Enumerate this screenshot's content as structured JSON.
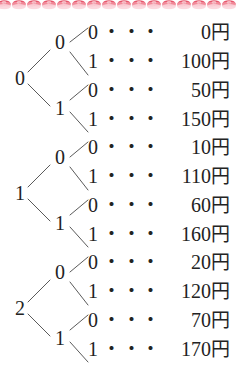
{
  "figure": {
    "currency_unit": "円",
    "dot_leader": "・",
    "line_color": "#5a5a5a",
    "text_color": "#232323",
    "border_color": "#e8596b",
    "background": "#ffffff"
  },
  "top_border": {
    "name": "decorative-scallop-border",
    "repeat_count": 16,
    "colors": [
      "#e4485f",
      "#f2909f",
      "#fbd4da"
    ]
  },
  "tree": {
    "groups": [
      {
        "root": "0",
        "branches": [
          {
            "label": "0",
            "leaves": [
              {
                "bit": "0",
                "amount": "0",
                "dots": "・・・・・・・・・・"
              },
              {
                "bit": "1",
                "amount": "100",
                "dots": "・・・・・・・"
              }
            ]
          },
          {
            "label": "1",
            "leaves": [
              {
                "bit": "0",
                "amount": "50",
                "dots": "・・・・・・"
              },
              {
                "bit": "1",
                "amount": "150",
                "dots": "・・・・・・・"
              }
            ]
          }
        ]
      },
      {
        "root": "1",
        "branches": [
          {
            "label": "0",
            "leaves": [
              {
                "bit": "0",
                "amount": "10",
                "dots": "・・・・・・"
              },
              {
                "bit": "1",
                "amount": "110",
                "dots": "・・・・・・・"
              }
            ]
          },
          {
            "label": "1",
            "leaves": [
              {
                "bit": "0",
                "amount": "60",
                "dots": "・・・・・・"
              },
              {
                "bit": "1",
                "amount": "160",
                "dots": "・・・・・・・"
              }
            ]
          }
        ]
      },
      {
        "root": "2",
        "branches": [
          {
            "label": "0",
            "leaves": [
              {
                "bit": "0",
                "amount": "20",
                "dots": "・・・・・・"
              },
              {
                "bit": "1",
                "amount": "120",
                "dots": "・・・・・・・"
              }
            ]
          },
          {
            "label": "1",
            "leaves": [
              {
                "bit": "0",
                "amount": "70",
                "dots": "・・・・・・"
              },
              {
                "bit": "1",
                "amount": "170",
                "dots": "・・・・・・・"
              }
            ]
          }
        ]
      }
    ]
  }
}
